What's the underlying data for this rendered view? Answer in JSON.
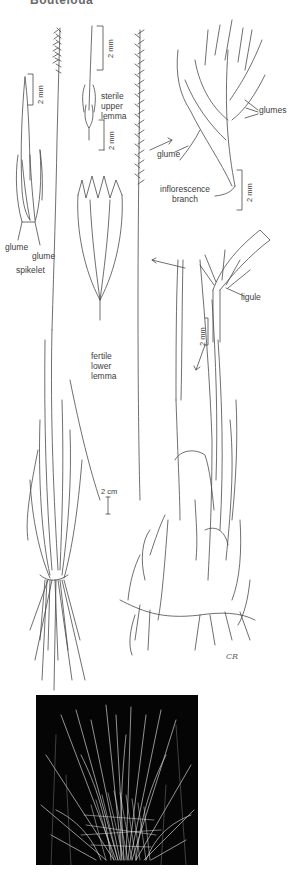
{
  "header": {
    "title": "Bouteloua"
  },
  "labels": {
    "glume_left_1": "glume",
    "glume_left_2": "glume",
    "spikelet": "spikelet",
    "sterile_upper_lemma": [
      "sterile",
      "upper",
      "lemma"
    ],
    "fertile_lower_lemma": [
      "fertile",
      "lower",
      "lemma"
    ],
    "glumes": "glumes",
    "glume_right": "glume",
    "inflorescence_branch": [
      "inflorescence",
      "branch"
    ],
    "ligule": "ligule"
  },
  "scale_bars": {
    "spikelet": "2 mm",
    "sterile_upper_lemma": "2 mm",
    "fertile_lower_lemma": "2 mm",
    "inflorescence_branch": "2 mm",
    "ligule": "2 mm",
    "habit": "2 cm"
  },
  "signature": "CR",
  "colors": {
    "ink": "#4a4a4a",
    "photo_background": "#050505",
    "photo_grass": "#cfcfcf"
  }
}
